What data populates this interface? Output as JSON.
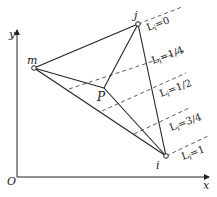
{
  "diagram": {
    "axes": {
      "x_label": "x",
      "y_label": "y",
      "origin_label": "O"
    },
    "points": [
      {
        "name": "m",
        "label": "m"
      },
      {
        "name": "j",
        "label": "j"
      },
      {
        "name": "i",
        "label": "i"
      },
      {
        "name": "P",
        "label": "P"
      }
    ],
    "level_lines": [
      {
        "label": "L",
        "sub": "i",
        "value": "=0"
      },
      {
        "label": "L",
        "sub": "i",
        "value": "=1/4"
      },
      {
        "label": "L",
        "sub": "i",
        "value": "=1/2"
      },
      {
        "label": "L",
        "sub": "i",
        "value": "=3/4"
      },
      {
        "label": "L",
        "sub": "i",
        "value": "=1"
      }
    ],
    "colors": {
      "line": "#222222",
      "background": "#ffffff"
    }
  }
}
